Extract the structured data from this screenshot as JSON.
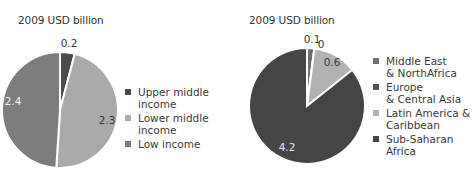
{
  "chart_data": [
    {
      "type": "pie",
      "title": "",
      "unit_label": "2009 USD billion",
      "categories": [
        "Upper middle income",
        "Lower middle income",
        "Low income"
      ],
      "values": [
        0.2,
        2.3,
        2.4
      ],
      "data_labels": [
        "0.2",
        "2.3",
        "2.4"
      ],
      "colors": [
        "#4a4a4a",
        "#aaaaaa",
        "#7d7d7d"
      ],
      "legend_position": "right"
    },
    {
      "type": "pie",
      "title": "",
      "unit_label": "2009 USD billion",
      "categories": [
        "Middle East & NorthAfrica",
        "Europe & Central Asia",
        "Latin America & Caribbean",
        "Sub-Saharan Africa"
      ],
      "values": [
        0.1,
        0.0,
        0.6,
        4.2
      ],
      "data_labels": [
        "0.1",
        "0",
        "0.6",
        "4.2"
      ],
      "colors": [
        "#6e6e6e",
        "#555555",
        "#b2b2b2",
        "#454545"
      ],
      "legend_position": "right"
    }
  ],
  "left": {
    "unit_label": "2009 USD billion",
    "legend": [
      {
        "label": "Upper middle income",
        "color": "#4a4a4a"
      },
      {
        "label": "Lower middle income",
        "color": "#aaaaaa"
      },
      {
        "label": "Low income",
        "color": "#7d7d7d"
      }
    ]
  },
  "right": {
    "unit_label": "2009 USD billion",
    "legend": [
      {
        "label": "Middle East\n& NorthAfrica",
        "color": "#6e6e6e"
      },
      {
        "label": "Europe\n& Central Asia",
        "color": "#555555"
      },
      {
        "label": "Latin America &\nCaribbean",
        "color": "#b2b2b2"
      },
      {
        "label": "Sub-Saharan Africa",
        "color": "#454545"
      }
    ]
  }
}
